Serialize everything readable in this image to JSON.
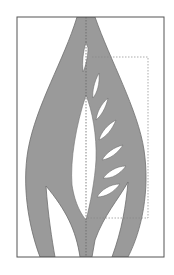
{
  "diagram": {
    "type": "paper-cut leaf template",
    "colors": {
      "background": "#ffffff",
      "frame": "#555555",
      "shape_fill": "#9a9a9a",
      "shape_stroke": "#6e6e6e",
      "cutout": "#ffffff",
      "guide": "#777777"
    },
    "frame": {
      "x": 17,
      "y": 17,
      "width": 147,
      "height": 240
    },
    "guides": {
      "center_fold_x": 86,
      "dashed_rect": {
        "x": 86,
        "y": 57,
        "width": 62,
        "height": 161
      }
    },
    "leaf_cutouts_count": 6
  }
}
